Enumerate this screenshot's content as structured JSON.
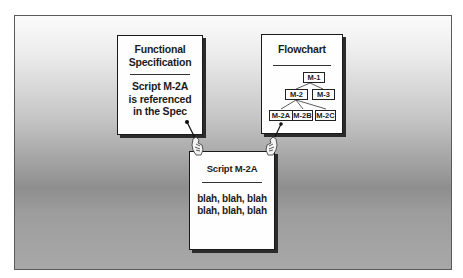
{
  "diagram": {
    "functional_spec": {
      "title_line1": "Functional",
      "title_line2": "Specification",
      "body_line1": "Script M-2A",
      "body_line2": "is referenced",
      "body_line3": "in the Spec"
    },
    "flowchart": {
      "title": "Flowchart",
      "nodes": {
        "m1": "M-1",
        "m2": "M-2",
        "m3": "M-3",
        "m2a": "M-2A",
        "m2b": "M-2B",
        "m2c": "M-2C"
      }
    },
    "script": {
      "title": "Script M-2A",
      "body_line1": "blah, blah, blah",
      "body_line2": "blah, blah, blah"
    },
    "icons": {
      "left_pointer": "pointing-hand-icon",
      "right_pointer": "pointing-hand-icon"
    },
    "colors": {
      "card_background": "#fefefe",
      "card_border": "#1a1a1a",
      "frame_gradient_top": "#fbfbfb",
      "frame_gradient_mid": "#8e8e8e",
      "frame_gradient_bottom": "#a8a8a8"
    }
  }
}
